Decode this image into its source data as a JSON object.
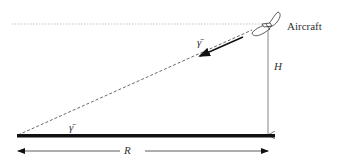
{
  "diagram": {
    "labels": {
      "aircraft": "Aircraft",
      "height": "H",
      "range": "R",
      "gamma_top": "γ̄",
      "gamma_bottom": "γ̄"
    },
    "elements": {
      "horizon_line": "dotted horizontal reference line at aircraft altitude",
      "ground": "thick horizontal ground line",
      "line_of_sight": "dashed line from aircraft to ground point",
      "velocity_arrow": "solid arrow along flight path",
      "height_arrow": "vertical arrow from aircraft to ground",
      "range_arrow": "double-headed horizontal range arrow"
    },
    "colors": {
      "line": "#333333",
      "ground": "#111111",
      "dotted": "#999999"
    }
  }
}
